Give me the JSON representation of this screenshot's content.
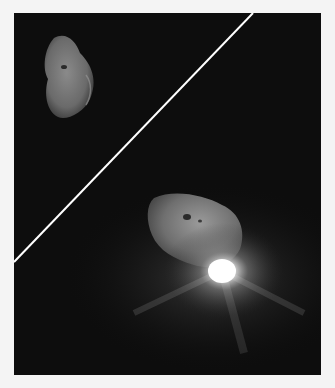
{
  "image": {
    "subject": "Comet nucleus before and after impact",
    "panels": [
      {
        "position": "upper-left",
        "description": "comet nucleus, pre-impact"
      },
      {
        "position": "lower-right",
        "description": "comet nucleus with bright impact flash and ejecta"
      }
    ],
    "colors": {
      "page_background": "#f4f4f4",
      "space_background": "#0d0d0d",
      "divider_line": "#ffffff",
      "nucleus_gray": "#7a7a7a",
      "flash": "#ffffff"
    }
  }
}
